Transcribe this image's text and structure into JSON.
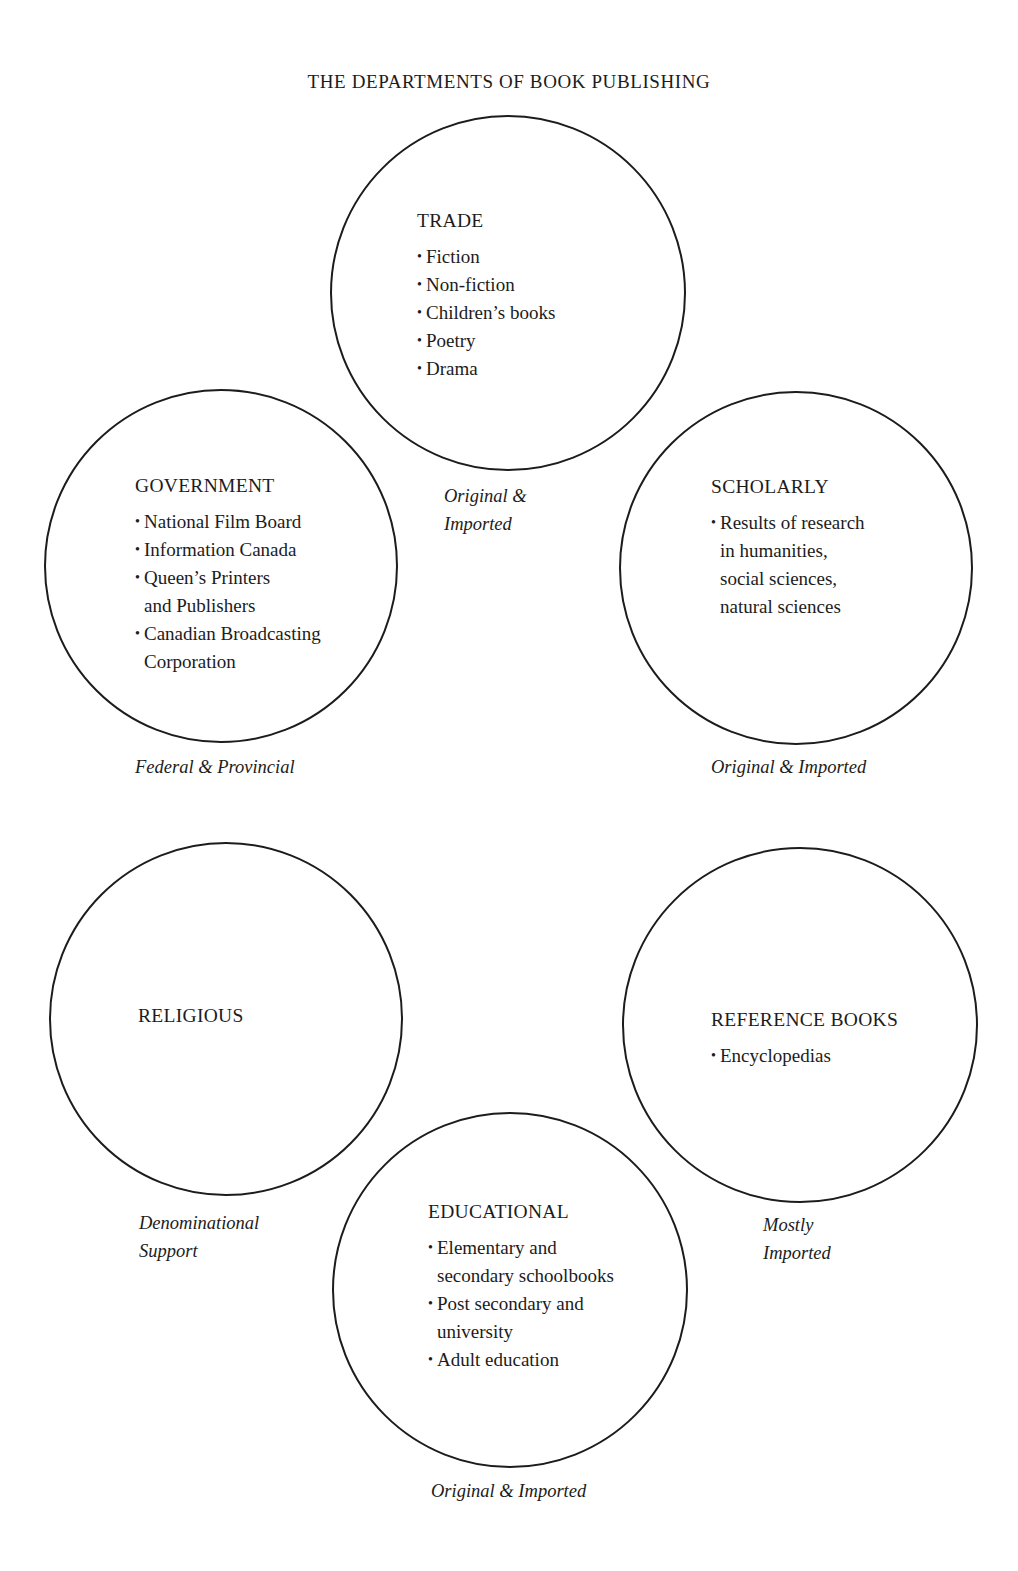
{
  "title": "THE DEPARTMENTS OF BOOK PUBLISHING",
  "colors": {
    "background": "#ffffff",
    "stroke": "#1c1c1c",
    "text": "#1c1c1c"
  },
  "circles": {
    "trade": {
      "heading": "TRADE",
      "items": [
        "Fiction",
        "Non-fiction",
        "Children’s books",
        "Poetry",
        "Drama"
      ],
      "note_lines": [
        "Original &",
        "Imported"
      ]
    },
    "government": {
      "heading": "GOVERNMENT",
      "items": [
        [
          "National Film Board"
        ],
        [
          "Information Canada"
        ],
        [
          "Queen’s Printers",
          "and Publishers"
        ],
        [
          "Canadian Broadcasting",
          "Corporation"
        ]
      ],
      "note": "Federal & Provincial"
    },
    "scholarly": {
      "heading": "SCHOLARLY",
      "items": [
        [
          "Results of research",
          "in humanities,",
          "social sciences,",
          "natural sciences"
        ]
      ],
      "note": "Original & Imported"
    },
    "religious": {
      "heading": "RELIGIOUS",
      "note_lines": [
        "Denominational",
        "Support"
      ]
    },
    "reference": {
      "heading": "REFERENCE BOOKS",
      "items": [
        "Encyclopedias"
      ],
      "note_lines": [
        "Mostly",
        "Imported"
      ]
    },
    "educational": {
      "heading": "EDUCATIONAL",
      "items": [
        [
          "Elementary and",
          "secondary schoolbooks"
        ],
        [
          "Post secondary and",
          "university"
        ],
        [
          "Adult education"
        ]
      ],
      "note": "Original & Imported"
    }
  },
  "bullet": "•"
}
